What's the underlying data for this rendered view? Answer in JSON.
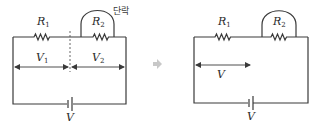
{
  "figure": {
    "left_circuit": {
      "resistors": [
        {
          "symbol": "R",
          "subscript": "1"
        },
        {
          "symbol": "R",
          "subscript": "2"
        }
      ],
      "short_label": "단락",
      "voltages": [
        {
          "symbol": "V",
          "subscript": "1"
        },
        {
          "symbol": "V",
          "subscript": "2"
        }
      ],
      "source_label": "V"
    },
    "transition_arrow": "⇒",
    "right_circuit": {
      "resistors": [
        {
          "symbol": "R",
          "subscript": "1"
        },
        {
          "symbol": "R",
          "subscript": "2"
        }
      ],
      "voltage_label": "V",
      "source_label": "V"
    },
    "colors": {
      "wire": "#3a3a3a",
      "arrow": "#c8c8c8",
      "background": "#ffffff"
    }
  }
}
